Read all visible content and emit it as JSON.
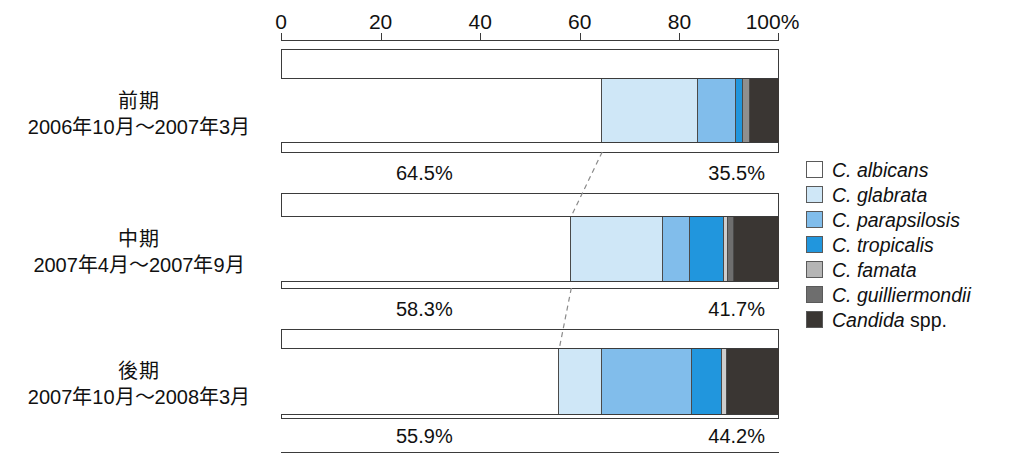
{
  "chart_data": {
    "type": "bar",
    "subtype": "stacked-horizontal-100pct",
    "title": "",
    "xlabel": "",
    "ylabel": "",
    "xlim": [
      0,
      100
    ],
    "grid": false,
    "legend_position": "right",
    "axis": {
      "ticks": [
        {
          "value": 0,
          "label": "0"
        },
        {
          "value": 20,
          "label": "20"
        },
        {
          "value": 40,
          "label": "40"
        },
        {
          "value": 60,
          "label": "60"
        },
        {
          "value": 80,
          "label": "80"
        },
        {
          "value": 100,
          "label": "100%"
        }
      ],
      "unit": "%"
    },
    "categories": [
      "前期 2006年10月～2007年3月",
      "中期 2007年4月～2007年9月",
      "後期 2007年10月～2008年3月"
    ],
    "series": [
      {
        "name": "C. albicans",
        "color": "#ffffff",
        "values": [
          64.5,
          58.3,
          55.9
        ]
      },
      {
        "name": "C. glabrata",
        "color": "#cfe7f7",
        "values": [
          19.2,
          18.4,
          8.6
        ]
      },
      {
        "name": "C. parapsilosis",
        "color": "#81bdeb",
        "values": [
          7.7,
          5.4,
          18.0
        ]
      },
      {
        "name": "C. tropicalis",
        "color": "#2196dd",
        "values": [
          1.4,
          6.8,
          6.1
        ]
      },
      {
        "name": "C. famata",
        "color": "#b5b5b5",
        "values": [
          1.4,
          0.9,
          1.0
        ]
      },
      {
        "name": "C. guilliermondii",
        "color": "#6e6e6e",
        "values": [
          0.0,
          1.2,
          0.0
        ]
      },
      {
        "name": "Candida spp.",
        "color": "#3a3633",
        "values": [
          5.8,
          9.0,
          10.4
        ]
      }
    ]
  },
  "legend": {
    "items": [
      {
        "label": "C. albicans",
        "italic_part": "C. albicans",
        "upright_part": "",
        "color": "#ffffff"
      },
      {
        "label": "C. glabrata",
        "italic_part": "C. glabrata",
        "upright_part": "",
        "color": "#cfe7f7"
      },
      {
        "label": "C. parapsilosis",
        "italic_part": "C. parapsilosis",
        "upright_part": "",
        "color": "#81bdeb"
      },
      {
        "label": "C. tropicalis",
        "italic_part": "C. tropicalis",
        "upright_part": "",
        "color": "#2196dd"
      },
      {
        "label": "C. famata",
        "italic_part": "C. famata",
        "upright_part": "",
        "color": "#b5b5b5"
      },
      {
        "label": "C. guilliermondii",
        "italic_part": "C. guilliermondii",
        "upright_part": "",
        "color": "#6e6e6e"
      },
      {
        "label": "Candida spp.",
        "italic_part": "Candida",
        "upright_part": " spp.",
        "color": "#3a3633"
      }
    ]
  },
  "periods": [
    {
      "label_line1": "前期",
      "label_line2": "2006年10月～2007年3月",
      "albicans_pct_label": "64.5%",
      "non_albicans_pct_label": "35.5%",
      "albicans_pct": 64.5,
      "non_albicans_pct": 35.5,
      "segments": [
        {
          "species": "C. albicans",
          "value": 64.5,
          "start": 0.0,
          "end": 64.5,
          "color": "#ffffff"
        },
        {
          "species": "C. glabrata",
          "value": 19.2,
          "start": 64.5,
          "end": 83.7,
          "color": "#cfe7f7"
        },
        {
          "species": "C. parapsilosis",
          "value": 7.7,
          "start": 83.7,
          "end": 91.4,
          "color": "#81bdeb"
        },
        {
          "species": "C. tropicalis",
          "value": 1.4,
          "start": 91.4,
          "end": 92.8,
          "color": "#2196dd"
        },
        {
          "species": "C. famata",
          "value": 1.4,
          "start": 92.8,
          "end": 94.2,
          "color": "#8f8f8f"
        },
        {
          "species": "Candida spp.",
          "value": 5.8,
          "start": 94.2,
          "end": 100.0,
          "color": "#3a3633"
        }
      ]
    },
    {
      "label_line1": "中期",
      "label_line2": "2007年4月～2007年9月",
      "albicans_pct_label": "58.3%",
      "non_albicans_pct_label": "41.7%",
      "albicans_pct": 58.3,
      "non_albicans_pct": 41.7,
      "segments": [
        {
          "species": "C. albicans",
          "value": 58.3,
          "start": 0.0,
          "end": 58.3,
          "color": "#ffffff"
        },
        {
          "species": "C. glabrata",
          "value": 18.4,
          "start": 58.3,
          "end": 76.7,
          "color": "#cfe7f7"
        },
        {
          "species": "C. parapsilosis",
          "value": 5.4,
          "start": 76.7,
          "end": 82.1,
          "color": "#81bdeb"
        },
        {
          "species": "C. tropicalis",
          "value": 6.8,
          "start": 82.1,
          "end": 88.9,
          "color": "#2196dd"
        },
        {
          "species": "C. famata",
          "value": 0.9,
          "start": 88.9,
          "end": 89.8,
          "color": "#cdcdcd"
        },
        {
          "species": "C. guilliermondii",
          "value": 1.2,
          "start": 89.8,
          "end": 91.0,
          "color": "#6e6e6e"
        },
        {
          "species": "Candida spp.",
          "value": 9.0,
          "start": 91.0,
          "end": 100.0,
          "color": "#3a3633"
        }
      ]
    },
    {
      "label_line1": "後期",
      "label_line2": "2007年10月～2008年3月",
      "albicans_pct_label": "55.9%",
      "non_albicans_pct_label": "44.2%",
      "albicans_pct": 55.9,
      "non_albicans_pct": 44.2,
      "segments": [
        {
          "species": "C. albicans",
          "value": 55.9,
          "start": 0.0,
          "end": 55.9,
          "color": "#ffffff"
        },
        {
          "species": "C. glabrata",
          "value": 8.6,
          "start": 55.9,
          "end": 64.5,
          "color": "#cfe7f7"
        },
        {
          "species": "C. parapsilosis",
          "value": 18.0,
          "start": 64.5,
          "end": 82.5,
          "color": "#81bdeb"
        },
        {
          "species": "C. tropicalis",
          "value": 6.1,
          "start": 82.5,
          "end": 88.6,
          "color": "#2196dd"
        },
        {
          "species": "C. famata",
          "value": 1.0,
          "start": 88.6,
          "end": 89.6,
          "color": "#cdcdcd"
        },
        {
          "species": "Candida spp.",
          "value": 10.4,
          "start": 89.6,
          "end": 100.0,
          "color": "#3a3633"
        }
      ]
    }
  ]
}
